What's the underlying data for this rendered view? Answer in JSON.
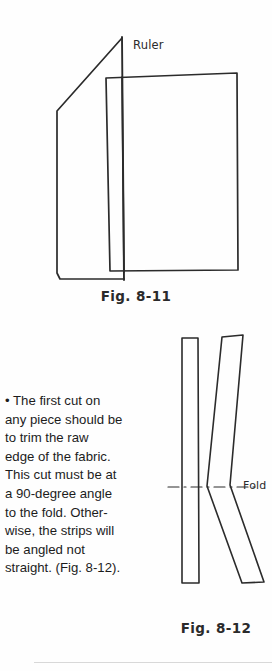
{
  "page": {
    "background_color": "#fefefe",
    "ink_color": "#2b2b2b"
  },
  "figures": [
    {
      "id": "fig-8-11",
      "caption": "Fig. 8-11",
      "labels": [
        {
          "name": "ruler",
          "text": "Ruler"
        }
      ],
      "description": "Hand-drawn diagram: a folded piece of fabric with a diagonal raw edge, overlaid by a rectangular fabric panel, with a vertical ruler line placed across them."
    },
    {
      "id": "fig-8-12",
      "caption": "Fig. 8-12",
      "labels": [
        {
          "name": "fold",
          "text": "Fold"
        }
      ],
      "description": "Hand-drawn diagram: a straight vertical fabric strip beside an angled strip bent at the fold line, showing a chevron shape; a dash-dot line marks the fold."
    }
  ],
  "body_text": {
    "bullet": "•",
    "lines": [
      "• The first cut on",
      "any piece should be",
      "to trim the raw",
      "edge of the fabric.",
      "This cut must be at",
      "a 90-degree angle",
      "to the fold. Other-",
      "wise, the strips will",
      "be angled not",
      "straight. (Fig. 8-12)."
    ],
    "full": "• The first cut on any piece should be to trim the raw edge of the fabric. This cut must be at a 90-degree angle to the fold. Otherwise, the strips will be angled not straight. (Fig. 8-12)."
  }
}
